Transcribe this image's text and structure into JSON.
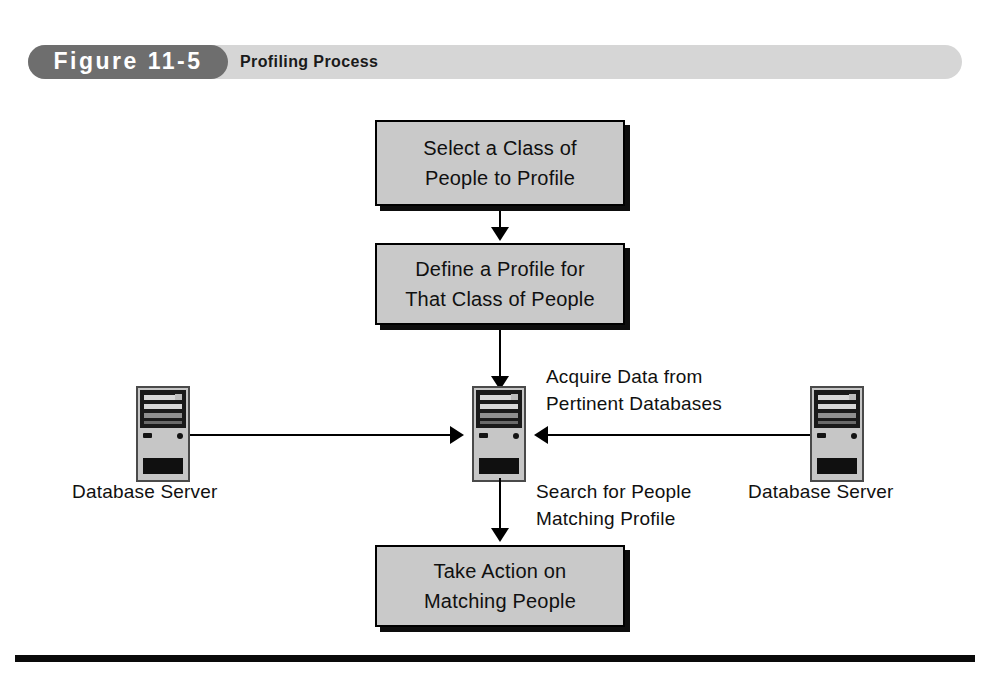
{
  "figure": {
    "number_label": "Figure 11-5",
    "title": "Profiling Process"
  },
  "colors": {
    "banner_bg": "#d6d6d6",
    "pill_bg": "#6e6e6e",
    "box_fill": "#c9c9c9",
    "box_border": "#000000",
    "box_shadow": "#0d0d0d",
    "connector": "#000000",
    "rule": "#0a0a0a"
  },
  "boxes": [
    {
      "id": "select",
      "line1": "Select a Class of",
      "line2": "People to Profile"
    },
    {
      "id": "define",
      "line1": "Define a Profile for",
      "line2": "That Class of People"
    },
    {
      "id": "action",
      "line1": "Take Action on",
      "line2": "Matching People"
    }
  ],
  "servers": [
    {
      "id": "left",
      "label": "Database Server"
    },
    {
      "id": "center",
      "label": ""
    },
    {
      "id": "right",
      "label": "Database Server"
    }
  ],
  "annotations": {
    "acquire": {
      "line1": "Acquire Data from",
      "line2": "Pertinent Databases"
    },
    "search": {
      "line1": "Search for People",
      "line2": "Matching Profile"
    }
  },
  "icons": {
    "server": "server-tower-icon",
    "arrow_down": "arrow-down-icon",
    "arrow_right": "arrow-right-icon",
    "arrow_left": "arrow-left-icon"
  }
}
